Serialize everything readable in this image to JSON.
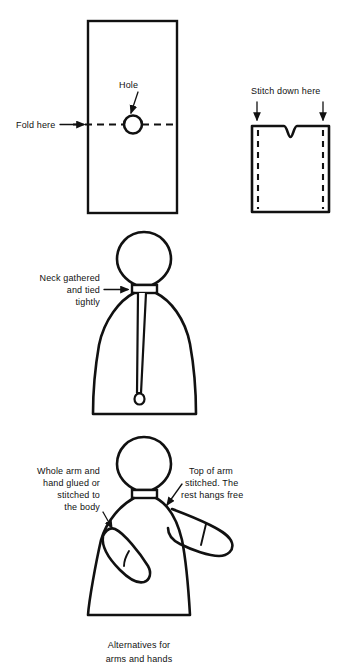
{
  "document": {
    "title": "Alternatives for arms and hands",
    "ink_color": "#111111",
    "background_color": "#ffffff"
  },
  "figures": {
    "fabric_rectangle": {
      "name": "Fabric rectangle with fold line and hole",
      "labels": {
        "fold_here": "Fold here",
        "hole": "Hole"
      }
    },
    "folded_piece": {
      "name": "Folded fabric with neck notch",
      "labels": {
        "stitch_down_here": "Stitch down here"
      }
    },
    "body_figure": {
      "name": "Doll body with gathered neck",
      "labels": {
        "neck_line1": "Neck gathered",
        "neck_line2": "and tied",
        "neck_line3": "tightly"
      }
    },
    "arms_figure": {
      "name": "Doll body with alternative arms",
      "labels": {
        "left_line1": "Whole arm and",
        "left_line2": "hand  glued or",
        "left_line3": "stitched to",
        "left_line4": "the body",
        "right_line1": "Top of arm",
        "right_line2": "stitched. The",
        "right_line3": "rest hangs free"
      }
    }
  },
  "caption": {
    "line1": "Alternatives for",
    "line2": "arms and hands"
  }
}
